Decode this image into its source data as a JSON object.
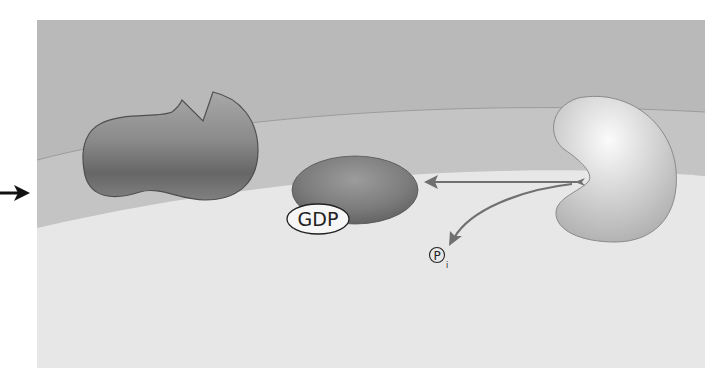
{
  "diagram": {
    "type": "cell-signaling-illustration",
    "colors": {
      "page_background": "#ffffff",
      "extracellular": "#b9b9b9",
      "membrane_band": "#c6c6c6",
      "cytoplasm": "#e6e6e6",
      "membrane_line": "#9a9a9a",
      "protein_outline": "#555555",
      "arrow": "#707070",
      "entry_arrow": "#111111"
    },
    "entry_arrow": {
      "direction": "right"
    },
    "left_protein": {
      "shape": "notched-receptor",
      "shade": "dark"
    },
    "g_protein": {
      "shape": "oval",
      "shade": "dark",
      "bound_label": "GDP"
    },
    "enzyme": {
      "shape": "kidney",
      "shade": "light"
    },
    "arrows": [
      {
        "from": "enzyme",
        "to": "g_protein",
        "style": "straight"
      },
      {
        "from": "enzyme",
        "to": "phosphate",
        "style": "curved"
      }
    ],
    "phosphate": {
      "symbol": "P",
      "subscript": "i"
    }
  }
}
